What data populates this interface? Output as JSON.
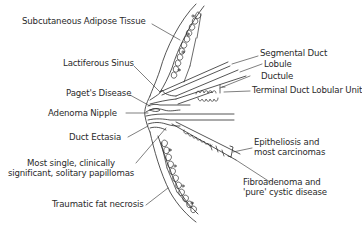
{
  "diagram": {
    "labels_left": [
      {
        "id": "subcutaneous",
        "text": "Subcutaneous Adipose Tissue"
      },
      {
        "id": "lactiferous",
        "text": "Lactiferous Sinus"
      },
      {
        "id": "paget",
        "text": "Paget's Disease"
      },
      {
        "id": "adenoma",
        "text": "Adenoma Nipple"
      },
      {
        "id": "ectasia",
        "text": "Duct Ectasia"
      },
      {
        "id": "papillomas",
        "line1": "Most single, clinically",
        "line2": "significant, solitary papillomas"
      },
      {
        "id": "fat_necrosis",
        "text": "Traumatic fat necrosis"
      }
    ],
    "labels_right": [
      {
        "id": "segmental",
        "text": "Segmental Duct"
      },
      {
        "id": "lobule",
        "text": "Lobule"
      },
      {
        "id": "ductule",
        "text": "Ductule"
      },
      {
        "id": "tdlu",
        "text": "Terminal Duct Lobular Unit"
      },
      {
        "id": "epitheliosis",
        "line1": "Epitheliosis and",
        "line2": "most carcinomas"
      },
      {
        "id": "fibroadenoma",
        "line1": "Fibroadenoma and",
        "line2": "'pure' cystic disease"
      }
    ],
    "colors": {
      "line": "#2a2a2a",
      "text": "#2a2a2a",
      "background": "#ffffff"
    }
  }
}
